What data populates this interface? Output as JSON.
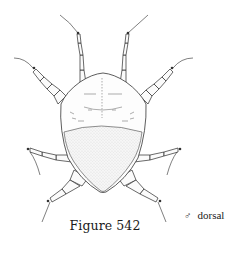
{
  "figure": {
    "caption": "Figure 542",
    "view_label": "dorsal",
    "sex_symbol": "♂",
    "colors": {
      "background": "#ffffff",
      "ink": "#2a2a2a"
    }
  }
}
